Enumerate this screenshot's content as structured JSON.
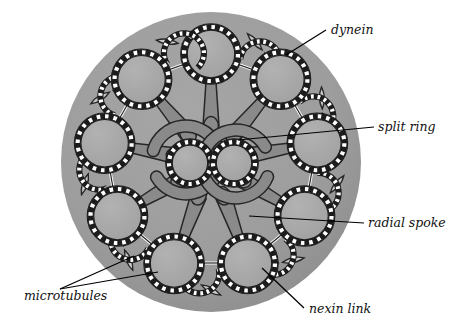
{
  "figure": {
    "background_color": "#ffffff",
    "matrix_color": "#9d9d9d",
    "matrix_shadow_color": "#8d8d8d",
    "tubule_fill": "#a8a8a8",
    "wall_color": "#1c1c1c",
    "subunit_color": "#ffffff",
    "spoke_fill": "#8a8a8a",
    "spoke_stroke": "#262626",
    "arm_fill": "#c9c9c9",
    "arm_stroke": "#262626",
    "leader_color": "#000000"
  },
  "labels": [
    {
      "id": "dynein",
      "text": "dynein",
      "x": 331,
      "y": 34,
      "anchor": "start"
    },
    {
      "id": "split-ring",
      "text": "split ring",
      "x": 378,
      "y": 131,
      "anchor": "start"
    },
    {
      "id": "radial-spoke",
      "text": "radial spoke",
      "x": 368,
      "y": 227,
      "anchor": "start"
    },
    {
      "id": "microtubules",
      "text": "microtubules",
      "x": 24,
      "y": 300,
      "anchor": "start"
    },
    {
      "id": "nexin-link",
      "text": "nexin link",
      "x": 309,
      "y": 313,
      "anchor": "start"
    }
  ],
  "leader_lines": [
    {
      "id": "dynein-leader",
      "points": "326,30 286,55"
    },
    {
      "id": "split-ring-leader",
      "points": "374,127 238,140"
    },
    {
      "id": "radial-spoke-leader",
      "points": "364,223 249,216"
    },
    {
      "id": "microtubules-leader-a",
      "points": "60,289 134,256"
    },
    {
      "id": "microtubules-leader-b",
      "points": "60,289 158,272"
    },
    {
      "id": "nexin-link-leader",
      "points": "304,308 262,268"
    }
  ],
  "structure": {
    "outer_circle": {
      "cx": 211,
      "cy": 162,
      "r": 150,
      "name": "plasma-membrane-matrix"
    },
    "outer_doublet_count": 9,
    "central_pair_count": 2,
    "split_ring_arc_count": 4,
    "radial_spoke_count": 9,
    "doublet_ring_radius": 27,
    "doublet_partner_radius": 20,
    "subunit_dashes": 20,
    "doublet_angles_deg": [
      -90,
      -50,
      -10,
      30,
      70,
      110,
      150,
      190,
      230
    ],
    "central_pair": [
      {
        "cx": 190,
        "cy": 163,
        "r": 21
      },
      {
        "cx": 234,
        "cy": 163,
        "r": 21
      }
    ]
  }
}
